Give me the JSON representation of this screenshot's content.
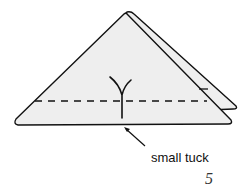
{
  "diagram": {
    "type": "origami-fold-step",
    "step_number": "5",
    "annotation": "small tuck",
    "colors": {
      "paper_fill": "#eeeeee",
      "line": "#111111",
      "background": "#ffffff"
    }
  }
}
